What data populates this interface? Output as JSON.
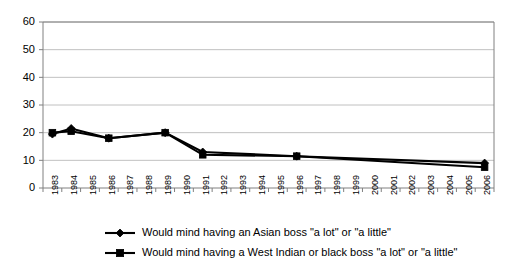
{
  "chart_data": {
    "type": "line",
    "title": "",
    "subtitle": "",
    "xlabel": "",
    "ylabel": "",
    "ylim": [
      0,
      60
    ],
    "ytick_step": 10,
    "yticks": [
      "0",
      "10",
      "20",
      "30",
      "40",
      "50",
      "60"
    ],
    "grid": true,
    "legend_position": "bottom",
    "categories": [
      "1983",
      "1984",
      "1985",
      "1986",
      "1987",
      "1988",
      "1989",
      "1990",
      "1991",
      "1992",
      "1993",
      "1994",
      "1995",
      "1996",
      "1997",
      "1998",
      "1999",
      "2000",
      "2001",
      "2002",
      "2003",
      "2004",
      "2005",
      "2006"
    ],
    "series": [
      {
        "name": "Would mind having an Asian boss \"a lot\" or \"a little\"",
        "marker": "diamond",
        "color": "#000000",
        "points": [
          {
            "x": "1983",
            "y": 19.5
          },
          {
            "x": "1984",
            "y": 21.5
          },
          {
            "x": "1986",
            "y": 18
          },
          {
            "x": "1989",
            "y": 20
          },
          {
            "x": "1991",
            "y": 13
          },
          {
            "x": "1996",
            "y": 11.5
          },
          {
            "x": "2006",
            "y": 9
          }
        ],
        "values": [
          19.5,
          21.5,
          null,
          18,
          null,
          null,
          20,
          null,
          13,
          null,
          null,
          null,
          null,
          11.5,
          null,
          null,
          null,
          null,
          null,
          null,
          null,
          null,
          null,
          9
        ]
      },
      {
        "name": "Would mind having a West Indian or black boss \"a lot\" or \"a little\"",
        "marker": "square",
        "color": "#000000",
        "points": [
          {
            "x": "1983",
            "y": 20
          },
          {
            "x": "1984",
            "y": 20.5
          },
          {
            "x": "1986",
            "y": 18
          },
          {
            "x": "1989",
            "y": 20
          },
          {
            "x": "1991",
            "y": 12
          },
          {
            "x": "1996",
            "y": 11.5
          },
          {
            "x": "2006",
            "y": 7.5
          }
        ],
        "values": [
          20,
          20.5,
          null,
          18,
          null,
          null,
          20,
          null,
          12,
          null,
          null,
          null,
          null,
          11.5,
          null,
          null,
          null,
          null,
          null,
          null,
          null,
          null,
          null,
          7.5
        ]
      }
    ],
    "legend": [
      {
        "label": "Would mind having an Asian boss \"a lot\" or \"a little\"",
        "marker": "diamond"
      },
      {
        "label": "Would mind having a West Indian or black boss \"a lot\" or \"a little\"",
        "marker": "square"
      }
    ]
  },
  "colors": {
    "background": "#ffffff",
    "grid": "#b0b0b0",
    "axis": "#808080",
    "series": "#000000"
  }
}
